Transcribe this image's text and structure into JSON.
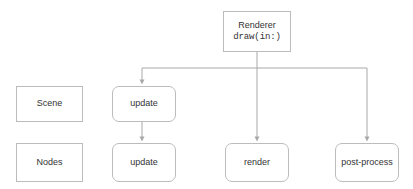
{
  "diagram": {
    "background_color": "#ffffff",
    "line_color": "#a9a9a9",
    "border_color": "#bcbcbc",
    "text_color": "#333333",
    "nodes": [
      {
        "id": "renderer",
        "label": "Renderer",
        "sublabel": "draw(in:)",
        "shape": "rect",
        "x": 223,
        "y": 11,
        "w": 68,
        "h": 41
      },
      {
        "id": "scene",
        "label": "Scene",
        "shape": "rect",
        "x": 16,
        "y": 86,
        "w": 67,
        "h": 36
      },
      {
        "id": "update-top",
        "label": "update",
        "shape": "rounded-rect",
        "x": 112,
        "y": 86,
        "w": 64,
        "h": 36
      },
      {
        "id": "nodes",
        "label": "Nodes",
        "shape": "rect",
        "x": 16,
        "y": 143,
        "w": 67,
        "h": 39
      },
      {
        "id": "update-bottom",
        "label": "update",
        "shape": "rounded-rect",
        "x": 112,
        "y": 143,
        "w": 64,
        "h": 39
      },
      {
        "id": "render",
        "label": "render",
        "shape": "rounded-rect",
        "x": 225,
        "y": 143,
        "w": 64,
        "h": 39
      },
      {
        "id": "post-process",
        "label": "post-process",
        "shape": "rounded-rect",
        "x": 335,
        "y": 143,
        "w": 64,
        "h": 39
      }
    ],
    "edges": [
      {
        "id": "renderer-to-bus",
        "from": "renderer",
        "to": "bus"
      },
      {
        "id": "bus-to-update-top",
        "from": "bus",
        "to": "update-top"
      },
      {
        "id": "bus-to-render",
        "from": "bus",
        "to": "render"
      },
      {
        "id": "bus-to-post-process",
        "from": "bus",
        "to": "post-process"
      },
      {
        "id": "update-top-to-update-bottom",
        "from": "update-top",
        "to": "update-bottom"
      }
    ]
  }
}
